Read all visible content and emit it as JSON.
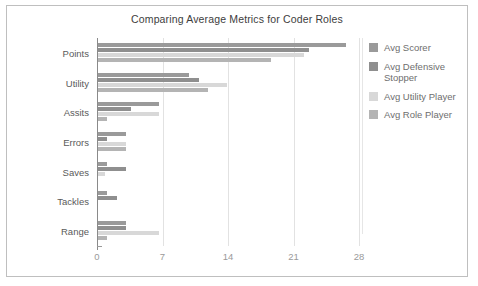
{
  "chart_data": {
    "type": "bar",
    "orientation": "horizontal",
    "title": "Comparing Average Metrics for Coder Roles",
    "xlabel": "",
    "ylabel": "",
    "xlim": [
      0,
      28
    ],
    "xticks": [
      "0",
      "7",
      "14",
      "21",
      "28"
    ],
    "xtick_values": [
      0,
      7,
      14,
      21,
      28
    ],
    "grid": true,
    "legend_position": "right",
    "categories": [
      "Points",
      "Utility",
      "Assits",
      "Errors",
      "Saves",
      "Tackles",
      "Range"
    ],
    "series": [
      {
        "name": "Avg Scorer",
        "color": "#9a9a9a",
        "values": [
          26.5,
          9.7,
          6.5,
          3.0,
          1.0,
          1.0,
          3.0
        ]
      },
      {
        "name": "Avg Defensive Stopper",
        "color": "#8f8f8f",
        "values": [
          22.5,
          10.8,
          3.5,
          1.0,
          3.0,
          2.0,
          3.0
        ]
      },
      {
        "name": "Avg Utility Player",
        "color": "#d8d8d8",
        "values": [
          22.0,
          13.8,
          6.5,
          3.0,
          0.8,
          0.0,
          6.5
        ]
      },
      {
        "name": "Avg Role Player",
        "color": "#b4b4b4",
        "values": [
          18.5,
          11.8,
          1.0,
          3.0,
          0.0,
          0.0,
          1.0
        ]
      }
    ]
  },
  "legend": {
    "items": [
      {
        "label": "Avg Scorer"
      },
      {
        "label": "Avg Defensive Stopper"
      },
      {
        "label": "Avg  Utility Player"
      },
      {
        "label": "Avg  Role Player"
      }
    ]
  },
  "colors": {
    "frame_border": "#bfbfbf",
    "gridline": "#e2e2e2",
    "axis": "#8a8a8a",
    "title_text": "#3d3d3d",
    "category_text": "#5a5a5a",
    "tick_text": "#9a9a9a",
    "legend_text": "#6e6e6e",
    "background": "#ffffff"
  }
}
